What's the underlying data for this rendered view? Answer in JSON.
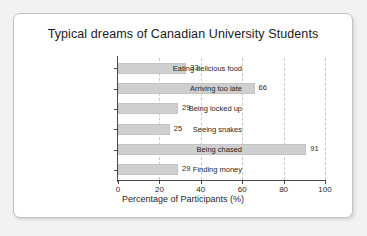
{
  "panel": {
    "background_color": "#ffffff",
    "border_color": "#c2c2c2",
    "page_background_color": "#f2f2f2"
  },
  "chart_data": {
    "type": "bar",
    "orientation": "horizontal",
    "title": "Typical dreams of Canadian University Students",
    "xlabel": "Percentage of Participants (%)",
    "ylabel": "",
    "categories": [
      "Eating delicious food",
      "Arriving too late",
      "Being locked up",
      "Seeing snakes",
      "Being chased",
      "Finding money"
    ],
    "values": [
      33,
      66,
      29,
      25,
      91,
      29
    ],
    "value_labels": [
      "33",
      "66",
      "29",
      "25",
      "91",
      "29"
    ],
    "xlim": [
      0,
      100
    ],
    "xticks": [
      0,
      20,
      40,
      60,
      80,
      100
    ],
    "xtick_labels": [
      "0",
      "20",
      "40",
      "60",
      "80",
      "100"
    ],
    "grid": "vertical-dashed",
    "legend": "none",
    "bar_color": "#cfcfcf",
    "bar_edge_color": "#c4c4c4",
    "axis_color": "#4a4a4a",
    "gridline_color": "#c9c9c9"
  }
}
